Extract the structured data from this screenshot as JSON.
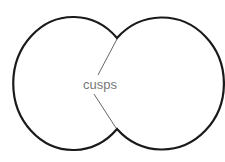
{
  "diagram": {
    "label": "cusps",
    "colors": {
      "outline": "#1a1a1a",
      "pointer": "#555555",
      "label": "#777777",
      "background": "#ffffff"
    },
    "shapes": [
      {
        "name": "left-circle",
        "cx": 72,
        "cy": 83.5,
        "rx": 60,
        "ry": 66.5
      },
      {
        "name": "right-circle",
        "cx": 160,
        "cy": 83.5,
        "rx": 62,
        "ry": 66
      }
    ],
    "cusp_points": [
      {
        "name": "top-cusp",
        "x": 117,
        "y": 38
      },
      {
        "name": "bottom-cusp",
        "x": 117,
        "y": 129
      }
    ]
  }
}
